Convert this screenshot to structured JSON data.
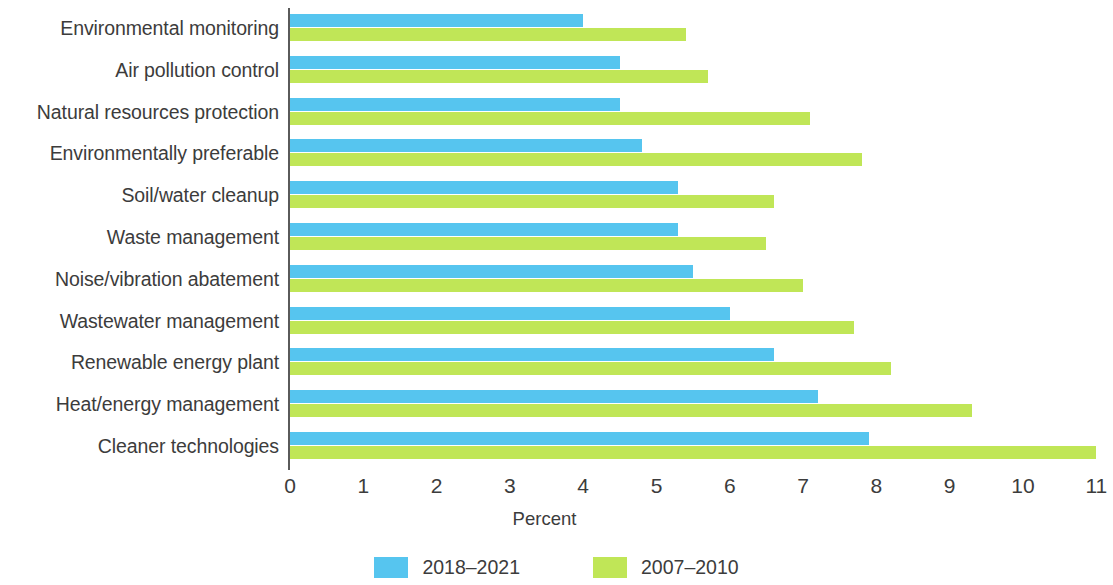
{
  "chart_data": {
    "type": "bar",
    "orientation": "horizontal",
    "title": "",
    "xlabel": "Percent",
    "ylabel": "",
    "xlim": [
      0,
      11
    ],
    "xticks": [
      0,
      1,
      2,
      3,
      4,
      5,
      6,
      7,
      8,
      9,
      10,
      11
    ],
    "xtick_labels": [
      "0",
      "1",
      "2",
      "3",
      "4",
      "5",
      "6",
      "7",
      "8",
      "9",
      "10",
      "11"
    ],
    "grid": false,
    "legend_position": "bottom",
    "categories": [
      "Environmental monitoring",
      "Air pollution control",
      "Natural resources protection",
      "Environmentally preferable",
      "Soil/water cleanup",
      "Waste management",
      "Noise/vibration abatement",
      "Wastewater management",
      "Renewable energy plant",
      "Heat/energy management",
      "Cleaner technologies"
    ],
    "series": [
      {
        "name": "2018–2021",
        "color": "#56c5ef",
        "values": [
          4.0,
          4.5,
          4.5,
          4.8,
          5.3,
          5.3,
          5.5,
          6.0,
          6.6,
          7.2,
          7.9
        ]
      },
      {
        "name": "2007–2010",
        "color": "#c0e657",
        "values": [
          5.4,
          5.7,
          7.1,
          7.8,
          6.6,
          6.5,
          7.0,
          7.7,
          8.2,
          9.3,
          11.0
        ]
      }
    ]
  }
}
